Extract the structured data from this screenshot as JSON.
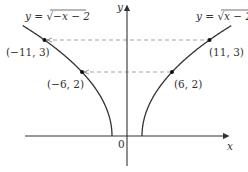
{
  "chart_data": {
    "type": "line",
    "title": "",
    "xlabel": "x",
    "ylabel": "y",
    "origin_label": "0",
    "grid": false,
    "series": [
      {
        "name": "y = √(−x − 2)",
        "label_prefix": "y = ",
        "label_radical": "−x − 2",
        "domain": [
          -13.9,
          -2
        ],
        "formula": "sqrt(-x-2)"
      },
      {
        "name": "y = √(x − 2)",
        "label_prefix": "y = ",
        "label_radical": "x − 2",
        "domain": [
          2,
          13.9
        ],
        "formula": "sqrt(x-2)"
      }
    ],
    "points": [
      {
        "x": -11,
        "y": 3,
        "label": "(−11, 3)"
      },
      {
        "x": -6,
        "y": 2,
        "label": "(−6, 2)"
      },
      {
        "x": 6,
        "y": 2,
        "label": "(6, 2)"
      },
      {
        "x": 11,
        "y": 3,
        "label": "(11, 3)"
      }
    ],
    "dashed_lines": [
      {
        "from": [
          -11,
          3
        ],
        "to": [
          11,
          3
        ]
      },
      {
        "from": [
          -6,
          2
        ],
        "to": [
          6,
          2
        ]
      }
    ],
    "xlim": [
      -13.5,
      15
    ],
    "ylim": [
      -1,
      4.2
    ],
    "colors": {
      "curve": "#333333",
      "axis": "#333333",
      "dashed": "#999999",
      "point": "#111111"
    }
  }
}
